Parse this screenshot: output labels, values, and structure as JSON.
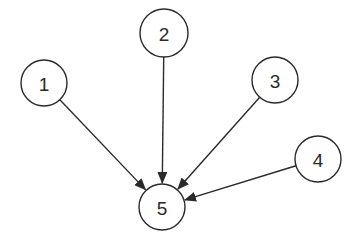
{
  "diagram": {
    "type": "directed-graph",
    "nodes": [
      {
        "id": "1",
        "label": "1",
        "cx": 44,
        "cy": 83,
        "r": 23
      },
      {
        "id": "2",
        "label": "2",
        "cx": 164,
        "cy": 33,
        "r": 24
      },
      {
        "id": "3",
        "label": "3",
        "cx": 275,
        "cy": 80,
        "r": 23
      },
      {
        "id": "4",
        "label": "4",
        "cx": 318,
        "cy": 159,
        "r": 23
      },
      {
        "id": "5",
        "label": "5",
        "cx": 162,
        "cy": 207,
        "r": 23
      }
    ],
    "edges": [
      {
        "from": "1",
        "to": "5"
      },
      {
        "from": "2",
        "to": "5"
      },
      {
        "from": "3",
        "to": "5"
      },
      {
        "from": "4",
        "to": "5"
      }
    ],
    "colors": {
      "stroke": "#2a2a2a",
      "background": "#ffffff"
    }
  }
}
